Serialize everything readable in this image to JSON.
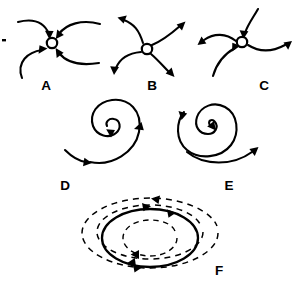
{
  "figure": {
    "background_color": "#ffffff",
    "stroke_color": "#000000",
    "width": 305,
    "height": 287
  },
  "panels": [
    {
      "id": "A",
      "label": "A",
      "type": "stable-node",
      "description": "Stable node (sink): four curved trajectories converge on the equilibrium point",
      "label_x": 46,
      "label_y": 90,
      "node": {
        "cx": 52,
        "cy": 43,
        "r": 5.2
      },
      "arrow_count": 4,
      "arrow_direction": "inward"
    },
    {
      "id": "B",
      "label": "B",
      "type": "unstable-node",
      "description": "Unstable node (source): four curved trajectories diverge from the equilibrium point",
      "label_x": 152,
      "label_y": 90,
      "node": {
        "cx": 147,
        "cy": 49,
        "r": 5.2
      },
      "arrow_count": 4,
      "arrow_direction": "outward"
    },
    {
      "id": "C",
      "label": "C",
      "type": "saddle-point",
      "description": "Saddle point: two trajectories approach and two trajectories depart the equilibrium point",
      "label_x": 264,
      "label_y": 90,
      "node": {
        "cx": 242,
        "cy": 42,
        "r": 5.2
      },
      "arrow_count": 4,
      "arrow_direction": "mixed"
    },
    {
      "id": "D",
      "label": "D",
      "type": "stable-spiral",
      "description": "Stable focus: trajectory spirals inward toward the equilibrium point",
      "label_x": 65,
      "label_y": 190,
      "center": {
        "cx": 110,
        "cy": 128
      },
      "spiral_direction": "inward",
      "rotation": "clockwise"
    },
    {
      "id": "E",
      "label": "E",
      "type": "unstable-spiral",
      "description": "Unstable focus: trajectory spirals outward away from the equilibrium point",
      "label_x": 229,
      "label_y": 190,
      "center": {
        "cx": 210,
        "cy": 125
      },
      "spiral_direction": "outward",
      "rotation": "clockwise"
    },
    {
      "id": "F",
      "label": "F",
      "type": "limit-cycle",
      "description": "Stable limit cycle: solid closed orbit with dashed trajectories spiralling onto it from outside and inside",
      "label_x": 219,
      "label_y": 275,
      "center": {
        "cx": 150,
        "cy": 238
      },
      "solid_orbit": {
        "rx": 48,
        "ry": 29
      },
      "outer_dashed": {
        "rx": 68,
        "ry": 40
      },
      "inner_dashed": {
        "rx": 27,
        "ry": 17
      }
    }
  ]
}
